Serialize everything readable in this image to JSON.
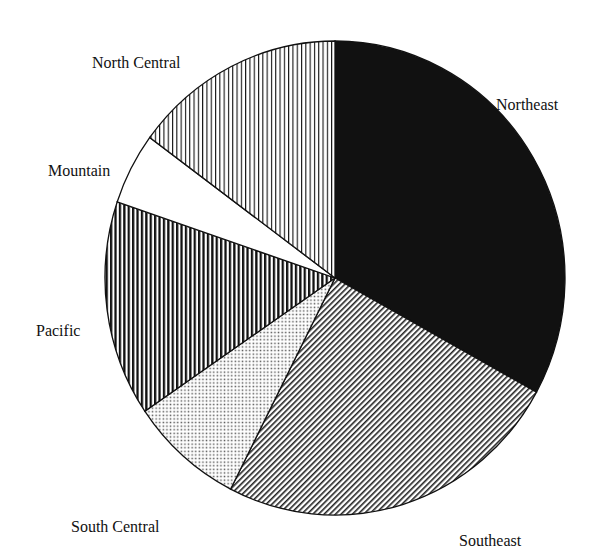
{
  "chart_data": {
    "type": "pie",
    "title": "",
    "start_angle_deg": 0,
    "direction": "clockwise",
    "slices": [
      {
        "label": "Northeast",
        "value": 33,
        "pattern": "solid-black"
      },
      {
        "label": "Southeast",
        "value": 24.5,
        "pattern": "diagonal-lines"
      },
      {
        "label": "South Central",
        "value": 8,
        "pattern": "dots"
      },
      {
        "label": "Pacific",
        "value": 14.7,
        "pattern": "thick-vertical-lines"
      },
      {
        "label": "Mountain",
        "value": 4.9,
        "pattern": "blank"
      },
      {
        "label": "North Central",
        "value": 14.9,
        "pattern": "thin-vertical-lines"
      }
    ],
    "legend": "none (direct labels)"
  },
  "labels": {
    "northeast": "Northeast",
    "southeast": "Southeast",
    "south_central": "South Central",
    "pacific": "Pacific",
    "mountain": "Mountain",
    "north_central": "North Central"
  },
  "colors": {
    "ink": "#111111",
    "background": "#ffffff"
  }
}
